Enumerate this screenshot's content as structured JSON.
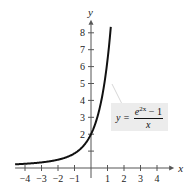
{
  "chart_data": {
    "type": "line",
    "title": "",
    "xlabel": "x",
    "ylabel": "y",
    "xlim": [
      -4.6,
      4.8
    ],
    "ylim": [
      0,
      8.6
    ],
    "x_ticks": [
      -4,
      -3,
      -2,
      -1,
      1,
      2,
      3,
      4
    ],
    "y_ticks": [
      1,
      2,
      3,
      4,
      5,
      6,
      7,
      8
    ],
    "x_tick_labels": [
      "−4",
      "−3",
      "−2",
      "−1",
      "1",
      "2",
      "3",
      "4"
    ],
    "y_tick_labels": [
      "",
      "2",
      "3",
      "4",
      "5",
      "6",
      "7",
      "8"
    ],
    "grid": false,
    "series": [
      {
        "name": "y = (e^(2x) − 1)/x",
        "x": [
          -4.6,
          -4,
          -3,
          -2,
          -1,
          -0.5,
          0,
          0.5,
          1,
          1.2
        ],
        "values": [
          0.217,
          0.25,
          0.333,
          0.491,
          0.865,
          1.264,
          2.0,
          3.437,
          6.389,
          8.19
        ]
      }
    ],
    "annotations": [
      {
        "text": "y = (e^{2x} − 1)/x",
        "points_to_x": 0.9,
        "points_to_y": 5
      }
    ]
  },
  "labels": {
    "x_axis": "x",
    "y_axis": "y",
    "eq_lhs": "y =",
    "eq_num_base": "e",
    "eq_num_exp": "2x",
    "eq_num_rest": " − 1",
    "eq_den": "x"
  }
}
